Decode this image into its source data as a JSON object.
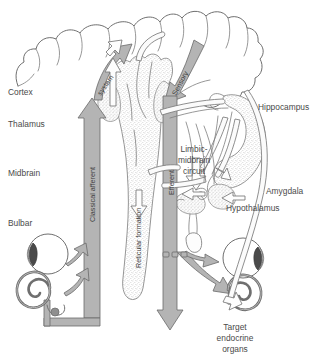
{
  "figure": {
    "background_color": "#ffffff",
    "arrow_fill_color": "#b4b4b4",
    "arrow_stroke_color": "#6a6a6a",
    "hollow_arrow_color": "#fdfdfd",
    "outline_color": "#6f6f6f",
    "label_color": "#4a4a4a",
    "stipple_color": "#8a8a8a"
  },
  "levels": {
    "cortex": "Cortex",
    "thalamus": "Thalamus",
    "midbrain": "Midbrain",
    "bulbar": "Bulbar"
  },
  "structures": {
    "hippocampus": "Hippocampus",
    "amygdala": "Amygdala",
    "hypothalamus": "Hypothalamus",
    "reticular_formation": "Reticular formation"
  },
  "pathways": {
    "classical_afferent": "Classical afferent",
    "system": "system",
    "sensory": "Sensory",
    "efferent": "Efferent",
    "limbic_line1": "Limbic-",
    "limbic_line2": "midbrain",
    "limbic_line3": "circuit"
  },
  "target": {
    "line1": "Target",
    "line2": "endocrine",
    "line3": "organs"
  },
  "organs": {
    "eye_left": "eye-left",
    "cochlea_left": "cochlea-left",
    "eye_right": "eye-right",
    "cochlea_right": "cochlea-right"
  }
}
